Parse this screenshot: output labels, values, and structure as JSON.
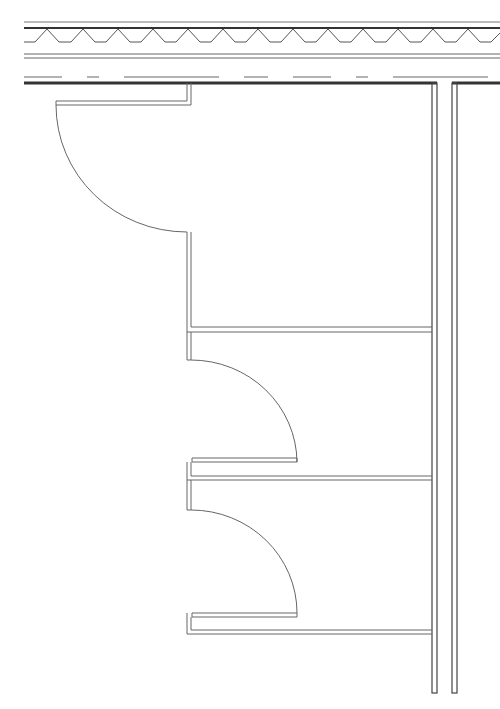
{
  "drawing": {
    "type": "architectural-floor-plan",
    "description": "Plan view of three rooms with swinging doors off a corridor, exterior wall with insulation at top",
    "colors": {
      "background": "#ffffff",
      "line": "#555555",
      "heavy_line": "#333333",
      "light_line": "#777777"
    },
    "elements": {
      "exterior_wall": {
        "label": ""
      },
      "rooms": [
        {
          "id": "room-1",
          "door_swing": "inward-left"
        },
        {
          "id": "room-2",
          "door_swing": "inward-right"
        },
        {
          "id": "room-3",
          "door_swing": "inward-right"
        }
      ]
    }
  }
}
